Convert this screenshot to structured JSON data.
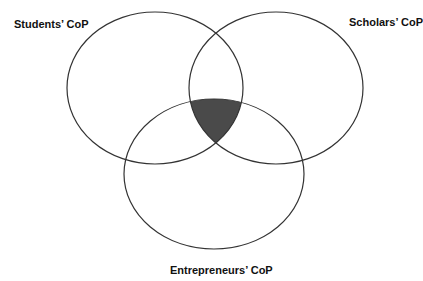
{
  "figure": {
    "labels": {
      "students": "Students’ CoP",
      "scholars": "Scholars’ CoP",
      "entrepreneurs": "Entrepreneurs’ CoP"
    },
    "sets": [
      {
        "name": "Students’ CoP",
        "cx": 155,
        "cy": 88,
        "rx": 88,
        "ry": 76
      },
      {
        "name": "Scholars’ CoP",
        "cx": 276,
        "cy": 88,
        "rx": 87,
        "ry": 76
      },
      {
        "name": "Entrepreneurs’ CoP",
        "cx": 214,
        "cy": 174,
        "rx": 90,
        "ry": 75
      }
    ],
    "intersection_fill": "#4a4a4a",
    "stroke_color": "#333333"
  }
}
